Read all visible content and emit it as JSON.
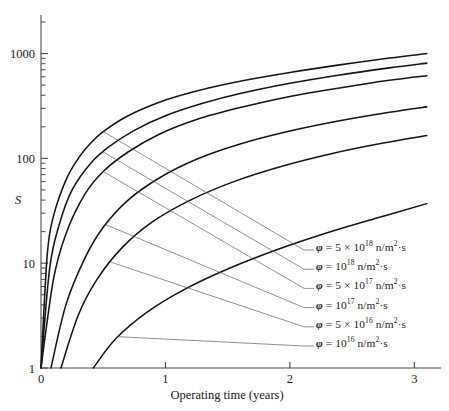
{
  "chart_data": {
    "type": "line",
    "title": "",
    "xlabel": "Operating time (years)",
    "ylabel": "S",
    "yscale": "log",
    "xlim": [
      0,
      3.15
    ],
    "ylim": [
      1,
      2000
    ],
    "grid": false,
    "legend_position": "inside-right",
    "x_ticks": [
      "0",
      "1",
      "2",
      "3"
    ],
    "x_tick_values": [
      0,
      1,
      2,
      3
    ],
    "y_ticks": [
      "1",
      "10",
      "100",
      "1000"
    ],
    "y_tick_values": [
      1,
      10,
      100,
      1000
    ],
    "series": [
      {
        "name": "phi = 5 x 10^18 n/m^2 . s",
        "label_html": "<span class=\"phi\">&phi;</span> = 5 &times; 10<sup>18</sup> n/m<sup>2</sup>&middot;s",
        "flux": 5e+18,
        "t_start": 0.0,
        "points": [
          [
            0.0,
            1
          ],
          [
            0.05,
            12
          ],
          [
            0.1,
            28
          ],
          [
            0.2,
            62
          ],
          [
            0.3,
            100
          ],
          [
            0.4,
            140
          ],
          [
            0.5,
            180
          ],
          [
            0.7,
            255
          ],
          [
            1.0,
            360
          ],
          [
            1.3,
            455
          ],
          [
            1.6,
            545
          ],
          [
            2.0,
            660
          ],
          [
            2.4,
            780
          ],
          [
            2.8,
            905
          ],
          [
            3.1,
            1000
          ]
        ]
      },
      {
        "name": "phi = 10^18 n/m^2 . s",
        "label_html": "<span class=\"phi\">&phi;</span> = 10<sup>18</sup> n/m<sup>2</sup>&middot;s",
        "flux": 1e+18,
        "t_start": 0.0,
        "points": [
          [
            0.0,
            1
          ],
          [
            0.07,
            9
          ],
          [
            0.15,
            24
          ],
          [
            0.25,
            50
          ],
          [
            0.4,
            90
          ],
          [
            0.55,
            130
          ],
          [
            0.75,
            185
          ],
          [
            1.0,
            255
          ],
          [
            1.3,
            335
          ],
          [
            1.6,
            415
          ],
          [
            2.0,
            520
          ],
          [
            2.4,
            625
          ],
          [
            2.8,
            730
          ],
          [
            3.1,
            810
          ]
        ]
      },
      {
        "name": "phi = 5 x 10^17 n/m^2 . s",
        "label_html": "<span class=\"phi\">&phi;</span> = 5 &times; 10<sup>17</sup> n/m<sup>2</sup>&middot;s",
        "flux": 5e+17,
        "t_start": 0.0,
        "points": [
          [
            0.0,
            1
          ],
          [
            0.1,
            7
          ],
          [
            0.2,
            19
          ],
          [
            0.35,
            45
          ],
          [
            0.5,
            75
          ],
          [
            0.7,
            115
          ],
          [
            0.95,
            170
          ],
          [
            1.25,
            235
          ],
          [
            1.6,
            305
          ],
          [
            2.0,
            390
          ],
          [
            2.4,
            470
          ],
          [
            2.8,
            555
          ],
          [
            3.1,
            615
          ]
        ]
      },
      {
        "name": "phi = 10^17 n/m^2 . s",
        "label_html": "<span class=\"phi\">&phi;</span> = 10<sup>17</sup> n/m<sup>2</sup>&middot;s",
        "flux": 1e+17,
        "t_start": 0.08,
        "points": [
          [
            0.08,
            1
          ],
          [
            0.2,
            4
          ],
          [
            0.35,
            11
          ],
          [
            0.5,
            22
          ],
          [
            0.7,
            40
          ],
          [
            0.95,
            65
          ],
          [
            1.25,
            98
          ],
          [
            1.6,
            137
          ],
          [
            2.0,
            182
          ],
          [
            2.4,
            228
          ],
          [
            2.8,
            275
          ],
          [
            3.1,
            310
          ]
        ]
      },
      {
        "name": "phi = 5 x 10^16 n/m^2 . s",
        "label_html": "<span class=\"phi\">&phi;</span> = 5 &times; 10<sup>16</sup> n/m<sup>2</sup>&middot;s",
        "flux": 5e+16,
        "t_start": 0.16,
        "points": [
          [
            0.16,
            1
          ],
          [
            0.3,
            3.2
          ],
          [
            0.45,
            7
          ],
          [
            0.65,
            14
          ],
          [
            0.9,
            25
          ],
          [
            1.2,
            40
          ],
          [
            1.55,
            60
          ],
          [
            1.95,
            85
          ],
          [
            2.35,
            112
          ],
          [
            2.75,
            140
          ],
          [
            3.1,
            165
          ]
        ]
      },
      {
        "name": "phi = 10^16 n/m^2 . s",
        "label_html": "<span class=\"phi\">&phi;</span> = 10<sup>16</sup> n/m<sup>2</sup>&middot;s",
        "flux": 1e+16,
        "t_start": 0.42,
        "points": [
          [
            0.42,
            1
          ],
          [
            0.6,
            1.9
          ],
          [
            0.85,
            3.4
          ],
          [
            1.15,
            5.6
          ],
          [
            1.5,
            8.8
          ],
          [
            1.9,
            13.5
          ],
          [
            2.3,
            19.5
          ],
          [
            2.7,
            27
          ],
          [
            3.1,
            37
          ]
        ]
      }
    ],
    "legend_entries": [
      "φ = 5 × 10^18 n/m^2·s",
      "φ = 10^18 n/m^2·s",
      "φ = 5 × 10^17 n/m^2·s",
      "φ = 10^17 n/m^2·s",
      "φ = 5 × 10^16 n/m^2·s",
      "φ = 10^16 n/m^2·s"
    ]
  },
  "figure": {
    "background": "#ffffff",
    "curve_color": "#151515",
    "axis_color": "#4a4a4a",
    "leader_color": "#555555"
  }
}
